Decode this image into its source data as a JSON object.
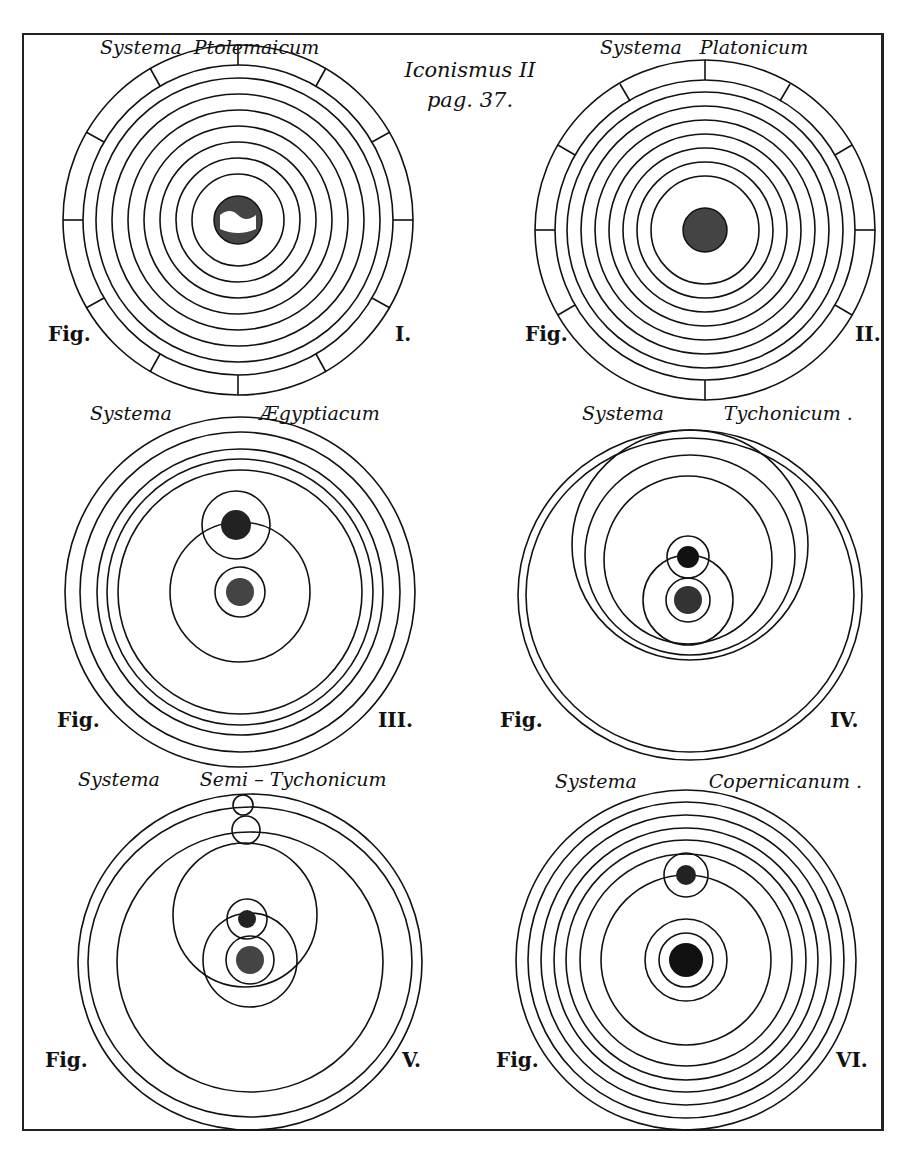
{
  "header": {
    "line1": "Iconismus II",
    "line2": "pag. 37."
  },
  "figures": [
    {
      "word": "Systema",
      "name": "Ptolemaicum",
      "fig": "Fig.",
      "num": "I."
    },
    {
      "word": "Systema",
      "name": "Platonicum",
      "fig": "Fig.",
      "num": "II."
    },
    {
      "word": "Systema",
      "name": "Ægyptiacum",
      "fig": "Fig.",
      "num": "III."
    },
    {
      "word": "Systema",
      "name": "Tychonicum .",
      "fig": "Fig.",
      "num": "IV."
    },
    {
      "word": "Systema",
      "name": "Semi – Tychonicum",
      "fig": "Fig.",
      "num": "V."
    },
    {
      "word": "Systema",
      "name": "Copernicanum .",
      "fig": "Fig.",
      "num": "VI."
    }
  ],
  "symbols": {
    "saturn": "♄",
    "jupiter": "♃",
    "mars": "♂",
    "venus": "♀",
    "mercury": "☿",
    "moon": "☽",
    "sun": "☀",
    "star": "✱"
  },
  "zodiac": [
    "♍",
    "♌",
    "♋",
    "♊",
    "♉",
    "♈",
    "♓",
    "♒",
    "♑",
    "♐",
    "♏",
    "♎"
  ],
  "colors": {
    "ink": "#111111",
    "paper": "#ffffff"
  }
}
